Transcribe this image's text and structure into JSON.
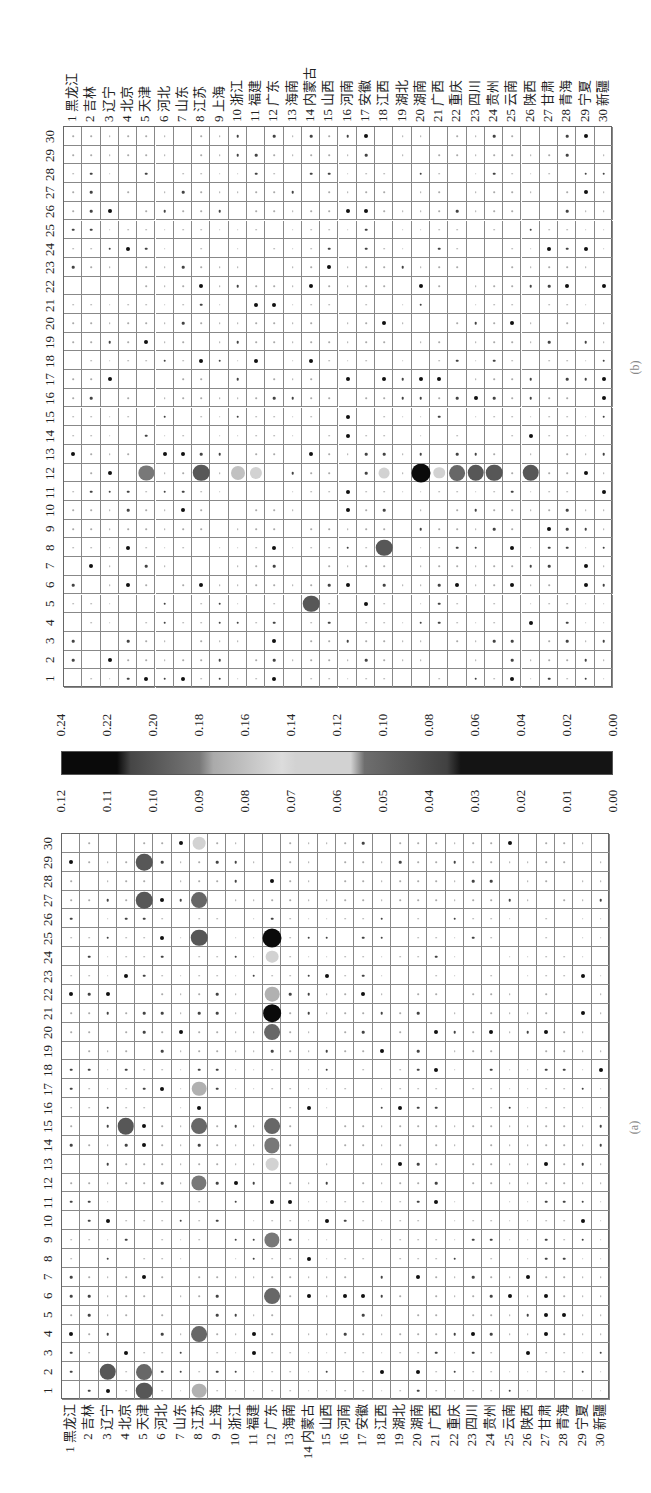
{
  "chart_data": [
    {
      "type": "heatmap",
      "title": "(a)",
      "subtype": "bubble-correlogram",
      "orientation": "rotated -90deg",
      "row_labels": [
        "1 黑龙江",
        "2 吉林",
        "3 辽宁",
        "4 北京",
        "5 天津",
        "6 河北",
        "7 山东",
        "8 江苏",
        "9 上海",
        "10 浙江",
        "11 福建",
        "12 广东",
        "13 海南",
        "14 内蒙古",
        "15 山西",
        "16 河南",
        "17 安徽",
        "18 江西",
        "19 湖北",
        "20 湖南",
        "21 广西",
        "22 重庆",
        "23 四川",
        "24 贵州",
        "25 云南",
        "26 陕西",
        "27 甘肃",
        "28 青海",
        "29 宁夏",
        "30 新疆"
      ],
      "col_labels": [
        "1",
        "2",
        "3",
        "4",
        "5",
        "6",
        "7",
        "8",
        "9",
        "10",
        "11",
        "12",
        "13",
        "14",
        "15",
        "16",
        "17",
        "18",
        "19",
        "20",
        "21",
        "22",
        "23",
        "24",
        "25",
        "26",
        "27",
        "28",
        "29",
        "30"
      ],
      "colorbar": {
        "min": 0.0,
        "max": 0.12,
        "ticks": [
          "0.12",
          "0.11",
          "0.10",
          "0.09",
          "0.08",
          "0.07",
          "0.06",
          "0.05",
          "0.04",
          "0.03",
          "0.02",
          "0.01",
          "0.00"
        ]
      },
      "notable_cells": [
        {
          "row": 12,
          "col": 25,
          "value": 0.12
        },
        {
          "row": 12,
          "col": 21,
          "value": 0.11
        },
        {
          "row": 12,
          "col": 24,
          "value": 0.07
        },
        {
          "row": 12,
          "col": 22,
          "value": 0.085
        },
        {
          "row": 12,
          "col": 13,
          "value": 0.07
        },
        {
          "row": 12,
          "col": 20,
          "value": 0.095
        },
        {
          "row": 12,
          "col": 14,
          "value": 0.09
        },
        {
          "row": 12,
          "col": 15,
          "value": 0.095
        },
        {
          "row": 12,
          "col": 9,
          "value": 0.09
        },
        {
          "row": 12,
          "col": 6,
          "value": 0.095
        },
        {
          "row": 8,
          "col": 17,
          "value": 0.085
        },
        {
          "row": 8,
          "col": 30,
          "value": 0.07
        },
        {
          "row": 8,
          "col": 27,
          "value": 0.095
        },
        {
          "row": 8,
          "col": 25,
          "value": 0.1
        },
        {
          "row": 8,
          "col": 12,
          "value": 0.09
        },
        {
          "row": 8,
          "col": 15,
          "value": 0.095
        },
        {
          "row": 8,
          "col": 1,
          "value": 0.085
        },
        {
          "row": 8,
          "col": 4,
          "value": 0.095
        },
        {
          "row": 5,
          "col": 2,
          "value": 0.095
        },
        {
          "row": 5,
          "col": 1,
          "value": 0.1
        },
        {
          "row": 3,
          "col": 2,
          "value": 0.1
        },
        {
          "row": 4,
          "col": 15,
          "value": 0.1
        },
        {
          "row": 5,
          "col": 27,
          "value": 0.1
        },
        {
          "row": 5,
          "col": 29,
          "value": 0.1
        }
      ]
    },
    {
      "type": "heatmap",
      "title": "(b)",
      "subtype": "bubble-correlogram",
      "orientation": "rotated -90deg",
      "row_labels": [
        "1 黑龙江",
        "2 吉林",
        "3 辽宁",
        "4 北京",
        "5 天津",
        "6 河北",
        "7 山东",
        "8 江苏",
        "9 上海",
        "10 浙江",
        "11 福建",
        "12 广东",
        "13 海南",
        "14 内蒙古",
        "15 山西",
        "16 河南",
        "17 安徽",
        "18 江西",
        "19 湖北",
        "20 湖南",
        "21 广西",
        "22 重庆",
        "23 四川",
        "24 贵州",
        "25 云南",
        "26 陕西",
        "27 甘肃",
        "28 青海",
        "29 宁夏",
        "30 新疆"
      ],
      "col_labels": [
        "1",
        "2",
        "3",
        "4",
        "5",
        "6",
        "7",
        "8",
        "9",
        "10",
        "11",
        "12",
        "13",
        "14",
        "15",
        "16",
        "17",
        "18",
        "19",
        "20",
        "21",
        "22",
        "23",
        "24",
        "25",
        "26",
        "27",
        "28",
        "29",
        "30"
      ],
      "colorbar": {
        "min": 0.0,
        "max": 0.24,
        "ticks": [
          "0.24",
          "0.22",
          "0.20",
          "0.18",
          "0.16",
          "0.14",
          "0.12",
          "0.10",
          "0.08",
          "0.06",
          "0.04",
          "0.02",
          "0.00"
        ]
      },
      "notable_cells": [
        {
          "row": 20,
          "col": 12,
          "value": 0.24
        },
        {
          "row": 21,
          "col": 12,
          "value": 0.12
        },
        {
          "row": 18,
          "col": 12,
          "value": 0.11
        },
        {
          "row": 5,
          "col": 12,
          "value": 0.18
        },
        {
          "row": 8,
          "col": 12,
          "value": 0.2
        },
        {
          "row": 10,
          "col": 12,
          "value": 0.16
        },
        {
          "row": 11,
          "col": 12,
          "value": 0.13
        },
        {
          "row": 22,
          "col": 12,
          "value": 0.19
        },
        {
          "row": 23,
          "col": 12,
          "value": 0.2
        },
        {
          "row": 24,
          "col": 12,
          "value": 0.2
        },
        {
          "row": 26,
          "col": 12,
          "value": 0.2
        },
        {
          "row": 14,
          "col": 5,
          "value": 0.2
        },
        {
          "row": 18,
          "col": 8,
          "value": 0.2
        }
      ]
    }
  ],
  "panels": {
    "a": {
      "caption": "(a)"
    },
    "b": {
      "caption": "(b)"
    }
  }
}
